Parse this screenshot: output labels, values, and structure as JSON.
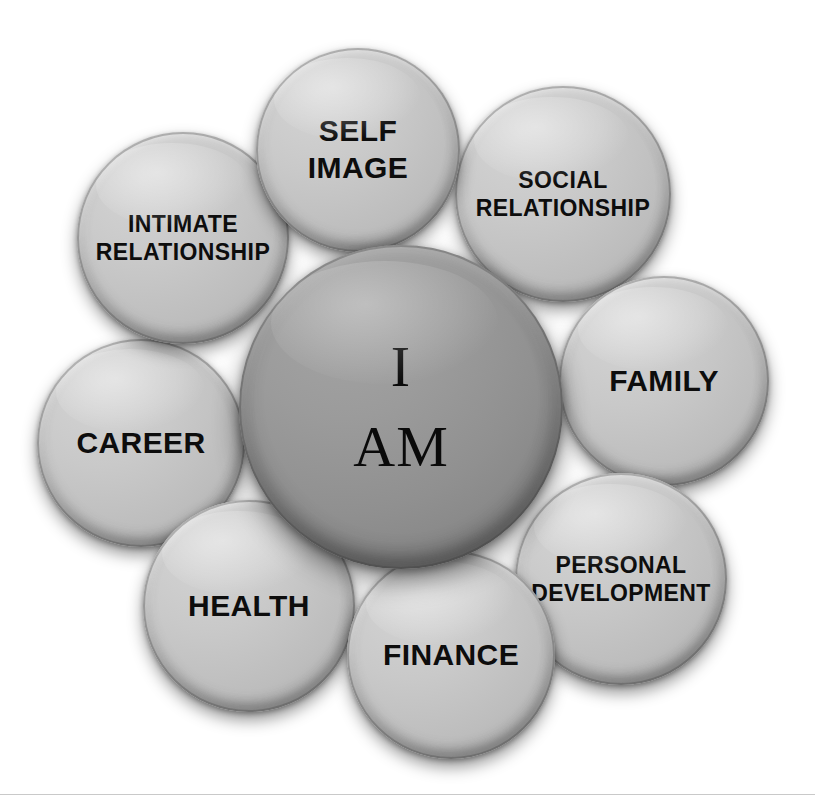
{
  "diagram": {
    "background_color": "#ffffff",
    "core": {
      "id": "core",
      "label": "I\nAM",
      "name": "i-am-core-bubble",
      "fill_color": "#8c8c8c",
      "text_color": "#0a0a0a",
      "cx": 401,
      "cy": 407,
      "r": 162,
      "font_size": 58,
      "font_style": "serif"
    },
    "satellites": [
      {
        "id": "self-image",
        "label": "SELF\nIMAGE",
        "name": "bubble-self-image",
        "fill_color": "#c4c4c4",
        "text_color": "#0d0d0d",
        "cx": 358,
        "cy": 150,
        "r": 102,
        "font_size": 30,
        "z": 4
      },
      {
        "id": "social-relationship",
        "label": "SOCIAL\nRELATIONSHIP",
        "name": "bubble-social-relationship",
        "fill_color": "#c4c4c4",
        "text_color": "#0d0d0d",
        "cx": 563,
        "cy": 194,
        "r": 108,
        "font_size": 23,
        "z": 3
      },
      {
        "id": "family",
        "label": "FAMILY",
        "name": "bubble-family",
        "fill_color": "#c4c4c4",
        "text_color": "#0d0d0d",
        "cx": 664,
        "cy": 381,
        "r": 105,
        "font_size": 30,
        "z": 3
      },
      {
        "id": "personal-development",
        "label": "PERSONAL\nDEVELOPMENT",
        "name": "bubble-personal-development",
        "fill_color": "#c4c4c4",
        "text_color": "#0d0d0d",
        "cx": 621,
        "cy": 579,
        "r": 106,
        "font_size": 23,
        "z": 3
      },
      {
        "id": "finance",
        "label": "FINANCE",
        "name": "bubble-finance",
        "fill_color": "#c4c4c4",
        "text_color": "#0d0d0d",
        "cx": 451,
        "cy": 655,
        "r": 104,
        "font_size": 30,
        "z": 5
      },
      {
        "id": "health",
        "label": "HEALTH",
        "name": "bubble-health",
        "fill_color": "#c4c4c4",
        "text_color": "#0d0d0d",
        "cx": 249,
        "cy": 606,
        "r": 106,
        "font_size": 30,
        "z": 4
      },
      {
        "id": "career",
        "label": "CAREER",
        "name": "bubble-career",
        "fill_color": "#c4c4c4",
        "text_color": "#0d0d0d",
        "cx": 141,
        "cy": 443,
        "r": 104,
        "font_size": 30,
        "z": 3
      },
      {
        "id": "intimate-relationship",
        "label": "INTIMATE\nRELATIONSHIP",
        "name": "bubble-intimate-relationship",
        "fill_color": "#c4c4c4",
        "text_color": "#0d0d0d",
        "cx": 183,
        "cy": 238,
        "r": 106,
        "font_size": 23,
        "z": 3
      }
    ]
  }
}
